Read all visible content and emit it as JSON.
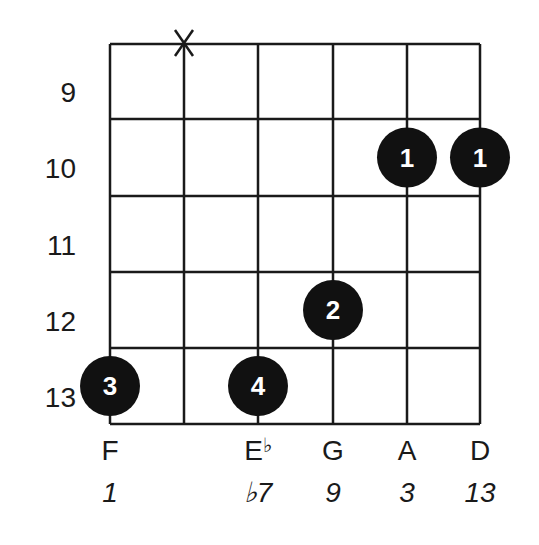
{
  "diagram": {
    "type": "guitar-chord-diagram",
    "colors": {
      "line": "#1a1a1a",
      "dot": "#111111",
      "dot_text": "#ffffff",
      "background": "#ffffff"
    },
    "grid": {
      "strings_x": [
        110,
        184,
        258,
        333,
        407,
        480
      ],
      "frets_y": [
        44,
        119,
        196,
        272,
        348,
        424
      ],
      "line_width": 2.5
    },
    "fret_numbers": [
      {
        "label": "9",
        "y": 92
      },
      {
        "label": "10",
        "y": 168
      },
      {
        "label": "11",
        "y": 245
      },
      {
        "label": "12",
        "y": 321
      },
      {
        "label": "13",
        "y": 397
      }
    ],
    "muted_strings": [
      {
        "string": 2,
        "symbol": "X"
      }
    ],
    "fingers": [
      {
        "string": 5,
        "fret": 10,
        "finger": "1"
      },
      {
        "string": 6,
        "fret": 10,
        "finger": "1"
      },
      {
        "string": 4,
        "fret": 12,
        "finger": "2"
      },
      {
        "string": 1,
        "fret": 13,
        "finger": "3"
      },
      {
        "string": 3,
        "fret": 13,
        "finger": "4"
      }
    ],
    "notes": [
      {
        "string": 1,
        "label": "F"
      },
      {
        "string": 3,
        "label": "E",
        "accidental": "♭"
      },
      {
        "string": 4,
        "label": "G"
      },
      {
        "string": 5,
        "label": "A"
      },
      {
        "string": 6,
        "label": "D"
      }
    ],
    "intervals": [
      {
        "string": 1,
        "label": "1"
      },
      {
        "string": 3,
        "label": "♭7"
      },
      {
        "string": 4,
        "label": "9"
      },
      {
        "string": 5,
        "label": "3"
      },
      {
        "string": 6,
        "label": "13"
      }
    ]
  }
}
